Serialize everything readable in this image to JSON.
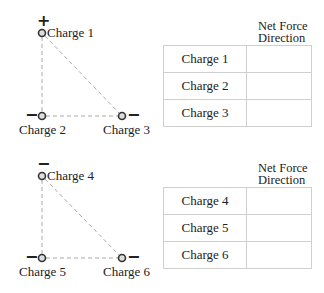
{
  "sections": [
    {
      "charges": [
        {
          "label": "Charge 1",
          "sign": "+"
        },
        {
          "label": "Charge 2",
          "sign": "−"
        },
        {
          "label": "Charge 3",
          "sign": "−"
        }
      ],
      "table": {
        "header_line1": "Net Force",
        "header_line2": "Direction",
        "rows": [
          {
            "name": "Charge 1",
            "direction": ""
          },
          {
            "name": "Charge 2",
            "direction": ""
          },
          {
            "name": "Charge 3",
            "direction": ""
          }
        ]
      }
    },
    {
      "charges": [
        {
          "label": "Charge 4",
          "sign": "−"
        },
        {
          "label": "Charge 5",
          "sign": "−"
        },
        {
          "label": "Charge 6",
          "sign": "−"
        }
      ],
      "table": {
        "header_line1": "Net Force",
        "header_line2": "Direction",
        "rows": [
          {
            "name": "Charge 4",
            "direction": ""
          },
          {
            "name": "Charge 5",
            "direction": ""
          },
          {
            "name": "Charge 6",
            "direction": ""
          }
        ]
      }
    }
  ],
  "colors": {
    "line": "#aaaaaa",
    "charge_stroke": "#333333",
    "charge_fill": "#cccccc",
    "table_border": "#cfcfcf"
  }
}
